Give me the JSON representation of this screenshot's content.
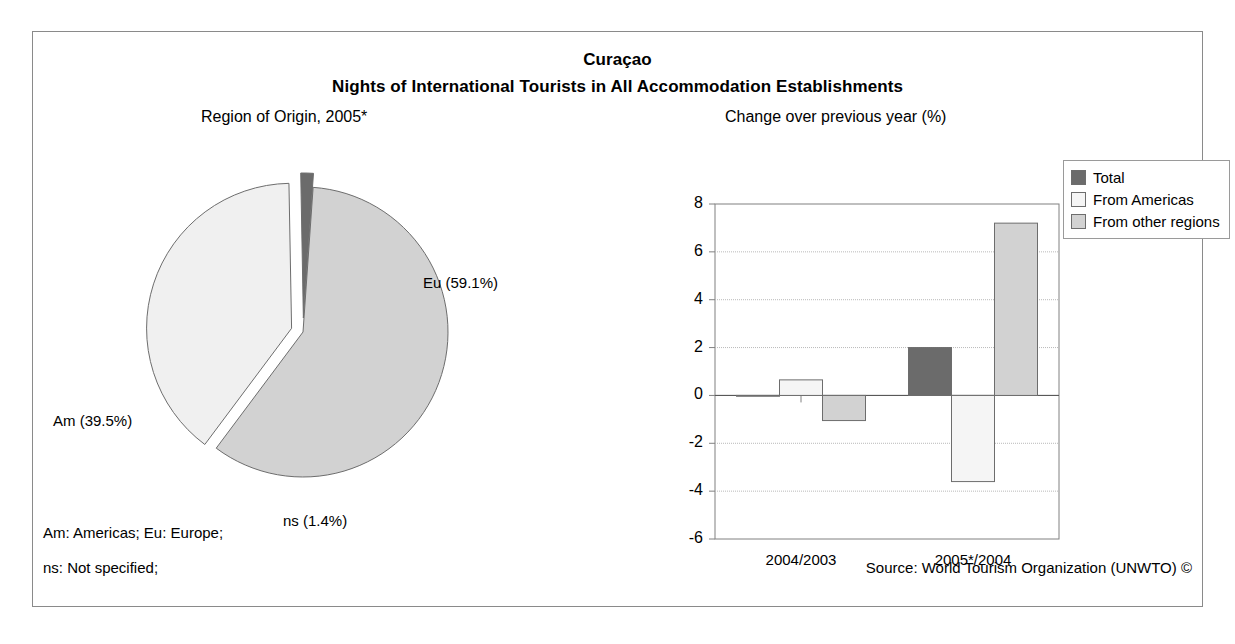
{
  "figure": {
    "title": "Curaçao",
    "subtitle": "Nights of International Tourists in All Accommodation Establishments",
    "pie_panel_title": "Region of Origin, 2005*",
    "bar_panel_title": "Change over previous year (%)",
    "footnote_1": "Am: Americas; Eu: Europe;",
    "footnote_2": "ns: Not specified;",
    "source": "Source: World Tourism Organization (UNWTO) ©",
    "border_color": "#8a8a8a"
  },
  "colors": {
    "total": "#6b6b6b",
    "from_americas": "#f5f5f5",
    "from_other_regions": "#d2d2d2",
    "pie_eu": "#d2d2d2",
    "pie_am": "#f0f0f0",
    "pie_ns": "#6b6b6b",
    "outline": "#6d6d6d",
    "gridline": "#b9b9b9",
    "axis": "#808080"
  },
  "chart_data": [
    {
      "type": "pie",
      "title": "Region of Origin, 2005*",
      "labels": [
        "Eu",
        "Am",
        "ns"
      ],
      "label_texts": [
        "Eu (59.1%)",
        "Am (39.5%)",
        "ns (1.4%)"
      ],
      "values": [
        59.1,
        39.5,
        1.4
      ],
      "units": "percent",
      "exploded": [
        "Am",
        "ns"
      ],
      "legend": "none",
      "slice_colors": [
        "#d2d2d2",
        "#f0f0f0",
        "#6b6b6b"
      ]
    },
    {
      "type": "bar",
      "title": "Change over previous year (%)",
      "xlabel": "",
      "ylabel": "",
      "categories": [
        "2004/2003",
        "2005*/2004"
      ],
      "ylim": [
        -6,
        8
      ],
      "yticks": [
        "8",
        "6",
        "4",
        "2",
        "0",
        "-2",
        "-4",
        "-6"
      ],
      "ytick_values": [
        8,
        6,
        4,
        2,
        0,
        -2,
        -4,
        -6
      ],
      "grid": "horizontal",
      "legend_position": "top-right",
      "series": [
        {
          "name": "Total",
          "values": [
            0.0,
            2.0
          ],
          "color": "#6b6b6b"
        },
        {
          "name": "From Americas",
          "values": [
            0.65,
            -3.6
          ],
          "color": "#f5f5f5"
        },
        {
          "name": "From other regions",
          "values": [
            -1.05,
            7.2
          ],
          "color": "#d2d2d2"
        }
      ]
    }
  ],
  "legend": {
    "items": [
      {
        "label": "Total",
        "color": "#6b6b6b"
      },
      {
        "label": "From Americas",
        "color": "#f5f5f5"
      },
      {
        "label": "From other regions",
        "color": "#d2d2d2"
      }
    ]
  }
}
